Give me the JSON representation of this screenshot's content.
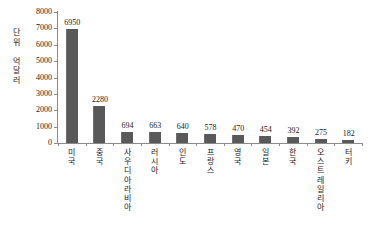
{
  "chart_data": {
    "type": "bar",
    "title": "",
    "xlabel": "",
    "ylabel": "단위 억달러",
    "ylim": [
      0,
      8000
    ],
    "ytick_step": 1000,
    "grid": false,
    "legend": "none",
    "bar_color": "#595959",
    "axis_color": "#8c8c8c",
    "text_color": "#1a1a1a",
    "categories": [
      "미국",
      "중국",
      "사우디아라비아",
      "러시아",
      "인도",
      "프랑스",
      "영국",
      "일본",
      "한국",
      "오스트레일리아",
      "터키"
    ],
    "values": [
      6950,
      2280,
      694,
      663,
      640,
      578,
      470,
      454,
      392,
      275,
      182
    ],
    "ytick_labels": [
      "8000",
      "7000",
      "6000",
      "5000",
      "4000",
      "3000",
      "2000",
      "1000",
      "0"
    ],
    "ytick_values": [
      8000,
      7000,
      6000,
      5000,
      4000,
      3000,
      2000,
      1000,
      0
    ],
    "value_labels": [
      "6950",
      "2280",
      "694",
      "663",
      "640",
      "578",
      "470",
      "454",
      "392",
      "275",
      "182"
    ]
  }
}
